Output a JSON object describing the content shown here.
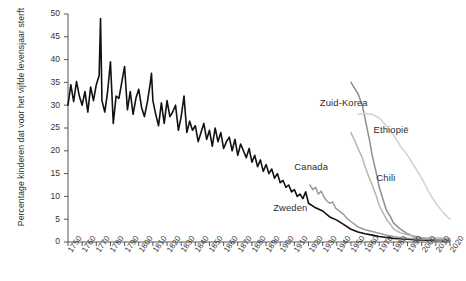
{
  "chart_data": {
    "type": "line",
    "title": "",
    "xlabel": "",
    "ylabel": "Percentage kinderen dat voor het vijfde levensjaar sterft",
    "xlim": [
      1750,
      2020
    ],
    "ylim": [
      0,
      50
    ],
    "grid": false,
    "legend_position": "inline-annotations",
    "xticks": [
      1750,
      1760,
      1770,
      1780,
      1790,
      1800,
      1810,
      1820,
      1830,
      1840,
      1850,
      1860,
      1870,
      1880,
      1890,
      1900,
      1910,
      1920,
      1930,
      1940,
      1950,
      1960,
      1970,
      1980,
      1990,
      2000,
      2010,
      2020
    ],
    "yticks": [
      0,
      5,
      10,
      15,
      20,
      25,
      30,
      35,
      40,
      45,
      50
    ],
    "series": [
      {
        "name": "Zweden",
        "color": "#111111",
        "label_x": 1895,
        "label_y": 7.5,
        "x": [
          1750,
          1752,
          1754,
          1756,
          1758,
          1760,
          1762,
          1764,
          1766,
          1768,
          1770,
          1772,
          1773,
          1774,
          1776,
          1778,
          1780,
          1782,
          1784,
          1786,
          1788,
          1790,
          1792,
          1794,
          1796,
          1798,
          1800,
          1802,
          1804,
          1806,
          1808,
          1809,
          1810,
          1812,
          1814,
          1816,
          1818,
          1820,
          1822,
          1824,
          1826,
          1828,
          1830,
          1832,
          1834,
          1836,
          1838,
          1840,
          1842,
          1844,
          1846,
          1848,
          1850,
          1852,
          1854,
          1856,
          1858,
          1860,
          1862,
          1864,
          1866,
          1868,
          1870,
          1872,
          1874,
          1876,
          1878,
          1880,
          1882,
          1884,
          1886,
          1888,
          1890,
          1892,
          1894,
          1896,
          1898,
          1900,
          1902,
          1904,
          1906,
          1908,
          1910,
          1912,
          1914,
          1916,
          1918,
          1920,
          1925,
          1930,
          1935,
          1940,
          1945,
          1950,
          1955,
          1960,
          1965,
          1970,
          1975,
          1980,
          1985,
          1990,
          1995,
          2000,
          2005,
          2010,
          2015,
          2020
        ],
        "y": [
          30.0,
          34.5,
          30.8,
          35.2,
          32.0,
          30.0,
          33.0,
          28.5,
          34.0,
          31.0,
          34.5,
          36.5,
          49.0,
          31.0,
          28.5,
          33.0,
          39.5,
          26.0,
          32.0,
          31.5,
          35.0,
          38.5,
          29.0,
          33.0,
          28.0,
          31.5,
          33.5,
          29.5,
          27.5,
          30.5,
          34.5,
          37.0,
          31.0,
          28.0,
          25.5,
          30.5,
          26.0,
          31.0,
          27.5,
          28.5,
          30.0,
          24.5,
          27.5,
          32.0,
          24.0,
          26.5,
          24.5,
          25.5,
          22.0,
          24.0,
          26.0,
          22.5,
          24.5,
          21.0,
          25.0,
          22.0,
          24.0,
          20.5,
          22.0,
          23.0,
          20.0,
          22.5,
          19.0,
          21.5,
          20.0,
          18.5,
          20.5,
          17.5,
          19.0,
          16.5,
          18.0,
          15.5,
          17.0,
          15.0,
          16.0,
          14.0,
          15.0,
          13.0,
          13.5,
          12.0,
          12.5,
          11.0,
          11.5,
          10.0,
          10.5,
          9.5,
          11.0,
          8.5,
          7.5,
          6.8,
          5.5,
          4.8,
          3.8,
          2.8,
          2.2,
          1.8,
          1.5,
          1.2,
          1.0,
          0.8,
          0.7,
          0.6,
          0.5,
          0.45,
          0.4,
          0.35,
          0.32,
          0.3
        ]
      },
      {
        "name": "Canada",
        "color": "#9b9b9b",
        "label_x": 1910,
        "label_y": 16.5,
        "x": [
          1921,
          1923,
          1925,
          1927,
          1929,
          1931,
          1933,
          1935,
          1937,
          1939,
          1941,
          1943,
          1945,
          1947,
          1950,
          1955,
          1960,
          1965,
          1970,
          1975,
          1980,
          1985,
          1990,
          1995,
          2000,
          2005,
          2010,
          2015,
          2020
        ],
        "y": [
          12.5,
          11.5,
          12.0,
          10.5,
          11.2,
          9.8,
          9.0,
          8.5,
          8.8,
          7.5,
          7.0,
          6.5,
          6.0,
          5.2,
          4.5,
          3.3,
          2.7,
          2.3,
          1.9,
          1.5,
          1.2,
          0.95,
          0.82,
          0.72,
          0.62,
          0.58,
          0.52,
          0.5,
          0.46
        ]
      },
      {
        "name": "Zuid-Korea",
        "color": "#8e8e8e",
        "label_x": 1928,
        "label_y": 30.5,
        "x": [
          1950,
          1952,
          1955,
          1958,
          1960,
          1963,
          1965,
          1968,
          1970,
          1973,
          1975,
          1978,
          1980,
          1985,
          1990,
          1995,
          2000,
          2005,
          2010,
          2015,
          2020
        ],
        "y": [
          35.0,
          34.0,
          32.5,
          30.0,
          27.0,
          22.5,
          19.0,
          15.0,
          12.0,
          9.0,
          7.0,
          5.5,
          4.2,
          2.8,
          1.8,
          1.1,
          0.75,
          0.55,
          0.42,
          0.35,
          0.3
        ]
      },
      {
        "name": "Chili",
        "color": "#b5b5b5",
        "label_x": 1968,
        "label_y": 14.0,
        "x": [
          1950,
          1953,
          1955,
          1958,
          1960,
          1963,
          1965,
          1968,
          1970,
          1973,
          1975,
          1978,
          1980,
          1985,
          1990,
          1995,
          2000,
          2005,
          2010,
          2015,
          2020
        ],
        "y": [
          24.0,
          22.0,
          20.5,
          18.5,
          16.5,
          14.0,
          12.5,
          10.0,
          8.0,
          6.2,
          5.0,
          3.8,
          2.9,
          2.0,
          1.6,
          1.3,
          1.0,
          0.9,
          0.85,
          0.8,
          0.72
        ]
      },
      {
        "name": "Ethiopië",
        "color": "#d2d2d2",
        "label_x": 1966,
        "label_y": 24.5,
        "x": [
          1955,
          1960,
          1965,
          1970,
          1975,
          1980,
          1985,
          1990,
          1995,
          2000,
          2005,
          2010,
          2015,
          2020
        ],
        "y": [
          28.0,
          28.2,
          28.0,
          27.2,
          25.5,
          23.5,
          21.0,
          19.0,
          16.5,
          14.0,
          11.0,
          8.5,
          6.5,
          5.0
        ]
      }
    ]
  }
}
